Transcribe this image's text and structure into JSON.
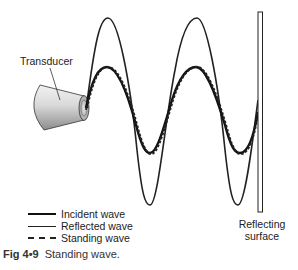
{
  "labels": {
    "transducer": "Transducer",
    "surface_line1": "Reflecting",
    "surface_line2": "surface"
  },
  "legend": [
    {
      "label": "Incident wave",
      "style": "solid-thick"
    },
    {
      "label": "Reflected wave",
      "style": "solid-thin"
    },
    {
      "label": "Standing wave",
      "style": "dashed"
    }
  ],
  "caption": {
    "fig_number": "Fig 4•9",
    "text": "Standing wave."
  },
  "colors": {
    "line": "#222222",
    "background": "#ffffff"
  }
}
